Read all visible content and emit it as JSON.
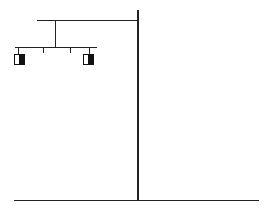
{
  "diagram": {
    "type": "pedigree",
    "colors": {
      "line": "#222222",
      "fill": "#111111",
      "background": "#ffffff"
    },
    "lines": [
      {
        "id": "top-horizontal",
        "x1": 37,
        "y1": 21,
        "x2": 138,
        "y2": 21
      },
      {
        "id": "main-vertical",
        "x1": 138,
        "y1": 10,
        "x2": 138,
        "y2": 200
      },
      {
        "id": "bottom-horizontal",
        "x1": 14,
        "y1": 200,
        "x2": 259,
        "y2": 200
      },
      {
        "id": "descent-line",
        "x1": 55,
        "y1": 21,
        "x2": 55,
        "y2": 48
      },
      {
        "id": "sibship-line",
        "x1": 15,
        "y1": 48,
        "x2": 96,
        "y2": 48
      },
      {
        "id": "child-tick-1",
        "x1": 18,
        "y1": 48,
        "x2": 18,
        "y2": 54
      },
      {
        "id": "child-tick-2",
        "x1": 43,
        "y1": 48,
        "x2": 43,
        "y2": 53
      },
      {
        "id": "child-tick-3",
        "x1": 70,
        "y1": 48,
        "x2": 70,
        "y2": 53
      },
      {
        "id": "child-tick-4",
        "x1": 89,
        "y1": 48,
        "x2": 89,
        "y2": 54
      }
    ],
    "individuals": [
      {
        "id": "male-1",
        "shape": "square",
        "x": 14,
        "y": 54,
        "size": 11,
        "status": "half-shaded-right"
      },
      {
        "id": "male-2",
        "shape": "square",
        "x": 83,
        "y": 54,
        "size": 11,
        "status": "half-shaded-right"
      }
    ]
  }
}
